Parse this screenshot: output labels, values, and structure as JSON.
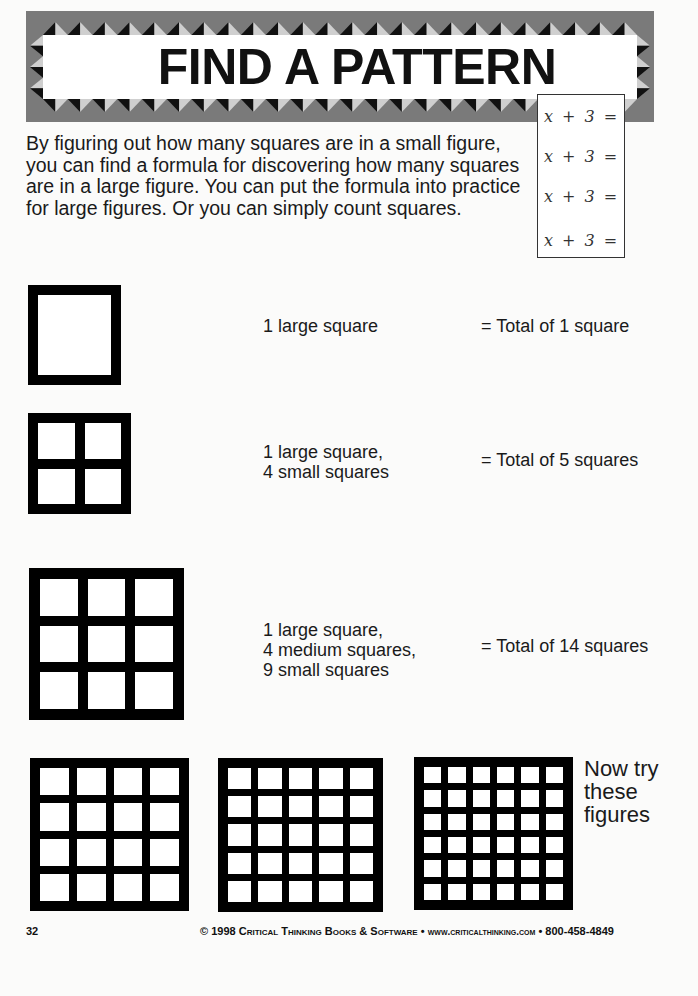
{
  "banner": {
    "title": "FIND A PATTERN",
    "colors": {
      "border_gray": "#7a7a7a",
      "triangle_dark": "#111111",
      "triangle_light": "#cfcfcf",
      "inner": "#ffffff"
    }
  },
  "formula_box": {
    "lines": [
      "x + 3 =",
      "x + 3 =",
      "x + 3 =",
      "x + 3 ="
    ]
  },
  "intro": {
    "text": "By figuring out how many squares are in a small figure, you can find a formula for discovering how many squares are in a large figure. You can put the formula into practice for large figures. Or you can simply count squares."
  },
  "examples": [
    {
      "grid": 1,
      "description_lines": [
        "1 large square"
      ],
      "total": "= Total of 1 square"
    },
    {
      "grid": 2,
      "description_lines": [
        "1 large square,",
        "4 small squares"
      ],
      "total": "= Total of 5 squares"
    },
    {
      "grid": 3,
      "description_lines": [
        "1 large square,",
        "4 medium squares,",
        "9 small squares"
      ],
      "total": "= Total of 14 squares"
    }
  ],
  "practice": {
    "grids": [
      4,
      5,
      6
    ],
    "prompt_lines": [
      "Now try",
      "these",
      "figures"
    ]
  },
  "footer": {
    "page_number": "32",
    "copyright": "© 1998",
    "publisher": "Critical Thinking Books & Software",
    "separator": "•",
    "website": "www.criticalthinking.com",
    "phone": "800-458-4849"
  }
}
